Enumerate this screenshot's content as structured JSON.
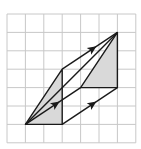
{
  "diagram": {
    "type": "grid-vector-translation",
    "grid": {
      "origin_x": 7,
      "origin_y": 14,
      "cell": 18.4,
      "cols": 7,
      "rows": 7,
      "line_color": "#c8c8c8",
      "border_color": "#c8c8c8"
    },
    "colors": {
      "stroke": "#1a1a1a",
      "shade": "#d9d9d9",
      "background": "#ffffff"
    },
    "points": {
      "A": [
        1,
        6
      ],
      "B": [
        3,
        6
      ],
      "C": [
        3,
        3
      ],
      "D": [
        6,
        1
      ],
      "E": [
        6,
        4
      ],
      "F": [
        4,
        4
      ]
    },
    "shapes": [
      {
        "name": "original-triangle",
        "vertices": [
          "A",
          "B",
          "C"
        ]
      },
      {
        "name": "translated-triangle",
        "vertices": [
          "F",
          "E",
          "D"
        ]
      }
    ],
    "vectors": [
      {
        "name": "vector-arrow-top",
        "from": "C",
        "to": "D"
      },
      {
        "name": "vector-arrow-middle",
        "from": "A",
        "to": "F"
      },
      {
        "name": "vector-arrow-bottom",
        "from": "B",
        "to": "E"
      }
    ],
    "extra_segments": [
      {
        "from": "A",
        "to": "D"
      }
    ]
  }
}
